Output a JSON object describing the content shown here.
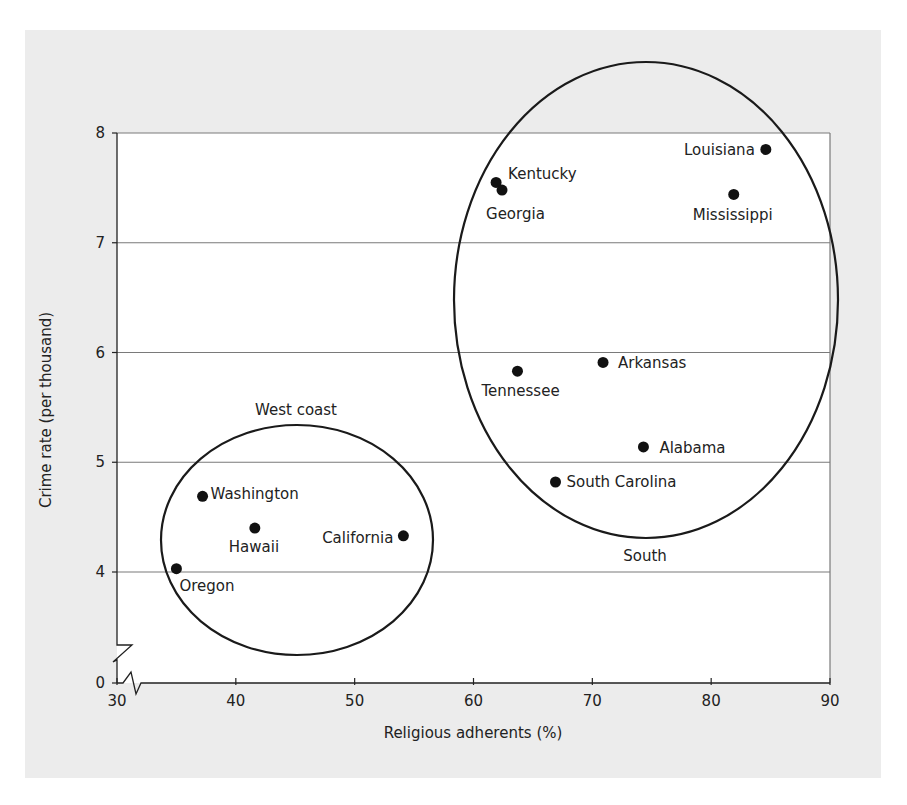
{
  "chart_data": {
    "type": "scatter",
    "title": "",
    "xlabel": "Religious adherents (%)",
    "ylabel": "Crime rate (per thousand)",
    "xlim": [
      30,
      90
    ],
    "ylim": [
      0,
      8
    ],
    "axis_break": {
      "x": "between 30 and ~33 (axis break marker)",
      "y": "between 0 and ~3.5 (axis break marker)"
    },
    "x_ticks": [
      30,
      40,
      50,
      60,
      70,
      80,
      90
    ],
    "y_ticks": [
      0,
      4,
      5,
      6,
      7,
      8
    ],
    "grid": {
      "horizontal": true,
      "vertical": false,
      "lines_at": [
        4,
        5,
        6,
        7,
        8
      ]
    },
    "legend": null,
    "points": [
      {
        "label": "Oregon",
        "x": 35.0,
        "y": 4.03,
        "group": "West coast"
      },
      {
        "label": "Washington",
        "x": 37.2,
        "y": 4.69,
        "group": "West coast"
      },
      {
        "label": "Hawaii",
        "x": 41.6,
        "y": 4.4,
        "group": "West coast"
      },
      {
        "label": "California",
        "x": 54.1,
        "y": 4.33,
        "group": "West coast"
      },
      {
        "label": "Kentucky",
        "x": 61.9,
        "y": 7.55,
        "group": "South"
      },
      {
        "label": "Georgia",
        "x": 62.4,
        "y": 7.48,
        "group": "South"
      },
      {
        "label": "Louisiana",
        "x": 84.6,
        "y": 7.85,
        "group": "South"
      },
      {
        "label": "Mississippi",
        "x": 81.9,
        "y": 7.44,
        "group": "South"
      },
      {
        "label": "Tennessee",
        "x": 63.7,
        "y": 5.83,
        "group": "South"
      },
      {
        "label": "Arkansas",
        "x": 70.9,
        "y": 5.91,
        "group": "South"
      },
      {
        "label": "Alabama",
        "x": 74.3,
        "y": 5.14,
        "group": "South"
      },
      {
        "label": "South Carolina",
        "x": 66.9,
        "y": 4.82,
        "group": "South"
      }
    ],
    "annotations": [
      {
        "type": "ellipse",
        "label": "West coast",
        "label_position": "above"
      },
      {
        "type": "ellipse",
        "label": "South",
        "label_position": "below"
      }
    ]
  },
  "colors": {
    "panel_background": "#ececec",
    "plot_background": "#ffffff",
    "gridline": "#7a7a7a",
    "marker": "#111111",
    "ellipse": "#1a1a1a"
  }
}
